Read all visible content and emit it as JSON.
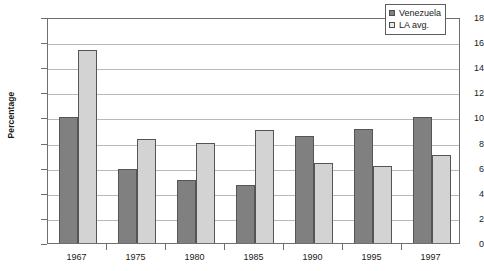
{
  "chart_data": {
    "type": "bar",
    "title": "",
    "xlabel": "",
    "ylabel": "Percentage",
    "categories": [
      "1967",
      "1975",
      "1980",
      "1985",
      "1990",
      "1995",
      "1997"
    ],
    "series": [
      {
        "name": "Venezuela",
        "color": "#808080",
        "values": [
          10.0,
          5.9,
          5.0,
          4.6,
          8.5,
          9.1,
          10.0
        ]
      },
      {
        "name": "LA avg.",
        "color": "#d3d3d3",
        "values": [
          15.4,
          8.3,
          8.0,
          9.0,
          6.4,
          6.1,
          7.0
        ]
      }
    ],
    "ylim": [
      0,
      18
    ],
    "ytick_step": 2,
    "yticks": [
      "0",
      "2",
      "4",
      "6",
      "8",
      "10",
      "12",
      "14",
      "16",
      "18"
    ],
    "grid": true,
    "legend_position": "top-right"
  }
}
